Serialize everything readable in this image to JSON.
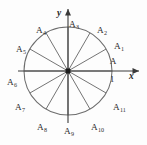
{
  "figure": {
    "type": "unit-circle-12-division-diagram",
    "title": "",
    "background_color": "#fdfdfd",
    "stroke_color": "#6d6d6d",
    "axis_color": "#3a3a3a",
    "label_color": "#2b2b2b"
  },
  "axes": {
    "x_label": "x",
    "y_label": "y",
    "x_tick_label": "1",
    "origin": {
      "x": 68,
      "y": 71
    },
    "x_axis_from": 18,
    "x_axis_to": 139,
    "y_axis_from": 123,
    "y_axis_to": 9
  },
  "circle": {
    "center_x": 68,
    "center_y": 71,
    "radius": 44,
    "divisions": 12,
    "step_degrees": 30
  },
  "points": [
    {
      "name": "A",
      "base": "A",
      "sub": "",
      "angle_deg": 0,
      "label_x": 113,
      "label_y": 64,
      "anchor": "middle"
    },
    {
      "name": "A1",
      "base": "A",
      "sub": "1",
      "angle_deg": 30,
      "label_x": 114,
      "label_y": 49,
      "anchor": "start"
    },
    {
      "name": "A2",
      "base": "A",
      "sub": "2",
      "angle_deg": 60,
      "label_x": 97,
      "label_y": 33,
      "anchor": "start"
    },
    {
      "name": "A3",
      "base": "A",
      "sub": "3",
      "angle_deg": 90,
      "label_x": 69,
      "label_y": 27,
      "anchor": "start"
    },
    {
      "name": "A4",
      "base": "A",
      "sub": "4",
      "angle_deg": 120,
      "label_x": 36,
      "label_y": 33,
      "anchor": "start"
    },
    {
      "name": "A5",
      "base": "A",
      "sub": "5",
      "angle_deg": 150,
      "label_x": 16,
      "label_y": 52,
      "anchor": "start"
    },
    {
      "name": "A6",
      "base": "A",
      "sub": "6",
      "angle_deg": 180,
      "label_x": 7,
      "label_y": 85,
      "anchor": "start"
    },
    {
      "name": "A7",
      "base": "A",
      "sub": "7",
      "angle_deg": 210,
      "label_x": 15,
      "label_y": 110,
      "anchor": "start"
    },
    {
      "name": "A8",
      "base": "A",
      "sub": "8",
      "angle_deg": 240,
      "label_x": 37,
      "label_y": 130,
      "anchor": "start"
    },
    {
      "name": "A9",
      "base": "A",
      "sub": "9",
      "angle_deg": 270,
      "label_x": 64,
      "label_y": 134,
      "anchor": "start"
    },
    {
      "name": "A10",
      "base": "A",
      "sub": "10",
      "angle_deg": 300,
      "label_x": 91,
      "label_y": 130,
      "anchor": "start"
    },
    {
      "name": "A11",
      "base": "A",
      "sub": "11",
      "angle_deg": 330,
      "label_x": 113,
      "label_y": 110,
      "anchor": "start"
    }
  ],
  "chart_data": {
    "type": "scatter",
    "title": "",
    "xlabel": "x",
    "ylabel": "y",
    "xlim": [
      -1.6,
      1.6
    ],
    "ylim": [
      -1.6,
      1.6
    ],
    "grid": false,
    "legend": "none",
    "annotations": [
      "1"
    ],
    "series": [
      {
        "name": "12th roots of unity on unit circle",
        "labels": [
          "A",
          "A1",
          "A2",
          "A3",
          "A4",
          "A5",
          "A6",
          "A7",
          "A8",
          "A9",
          "A10",
          "A11"
        ],
        "angles_deg": [
          0,
          30,
          60,
          90,
          120,
          150,
          180,
          210,
          240,
          270,
          300,
          330
        ],
        "x": [
          1.0,
          0.866,
          0.5,
          0.0,
          -0.5,
          -0.866,
          -1.0,
          -0.866,
          -0.5,
          0.0,
          0.5,
          0.866
        ],
        "y": [
          0.0,
          0.5,
          0.866,
          1.0,
          0.866,
          0.5,
          0.0,
          -0.5,
          -0.866,
          -1.0,
          -0.866,
          -0.5
        ]
      }
    ]
  }
}
